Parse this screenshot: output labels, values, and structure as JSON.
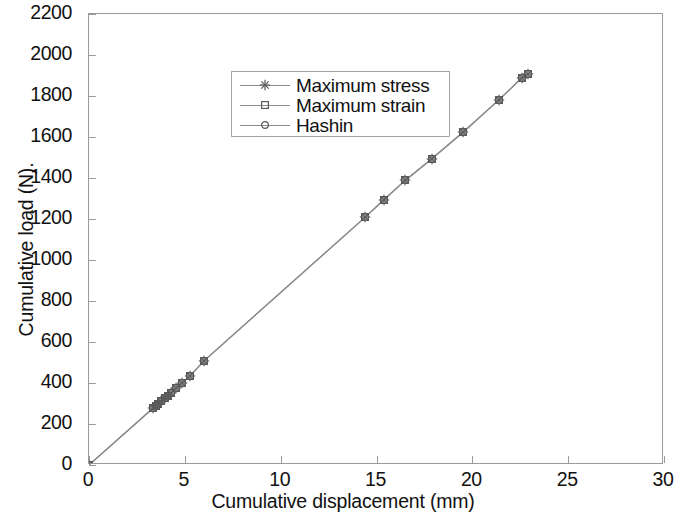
{
  "chart_data": {
    "type": "scatter",
    "title": "",
    "xlabel": "Cumulative displacement (mm)",
    "ylabel": "Cumulative load (N).",
    "xlim": [
      0,
      30
    ],
    "ylim": [
      0,
      2200
    ],
    "xticks": [
      0,
      5,
      10,
      15,
      20,
      25,
      30
    ],
    "yticks": [
      0,
      200,
      400,
      600,
      800,
      1000,
      1200,
      1400,
      1600,
      1800,
      2000,
      2200
    ],
    "grid": false,
    "legend_position": "upper-left-inside",
    "line_color": "#8d8d8d",
    "marker_color": "#5a5a5a",
    "series": [
      {
        "name": "Maximum stress",
        "marker": "asterisk",
        "x": [
          0,
          3.35,
          3.5,
          3.62,
          3.78,
          3.95,
          4.12,
          4.3,
          4.55,
          4.85,
          5.25,
          6.0,
          14.4,
          15.4,
          16.5,
          17.9,
          19.5,
          21.4,
          22.6,
          22.9
        ],
        "y": [
          0,
          278,
          290,
          300,
          312,
          325,
          338,
          352,
          375,
          400,
          432,
          508,
          1208,
          1295,
          1388,
          1495,
          1622,
          1782,
          1890,
          1908
        ]
      },
      {
        "name": "Maximum strain",
        "marker": "square",
        "x": [
          0,
          3.35,
          3.5,
          3.62,
          3.78,
          3.95,
          4.12,
          4.3,
          4.55,
          4.85,
          5.25,
          6.0,
          14.4,
          15.4,
          16.5,
          17.9,
          19.5,
          21.4,
          22.6,
          22.9
        ],
        "y": [
          0,
          278,
          290,
          300,
          312,
          325,
          338,
          352,
          375,
          400,
          432,
          508,
          1208,
          1295,
          1388,
          1495,
          1622,
          1782,
          1890,
          1908
        ]
      },
      {
        "name": "Hashin",
        "marker": "circle",
        "x": [
          0,
          3.35,
          3.5,
          3.62,
          3.78,
          3.95,
          4.12,
          4.3,
          4.55,
          4.85,
          5.25,
          6.0,
          14.4,
          15.4,
          16.5,
          17.9,
          19.5,
          21.4,
          22.6,
          22.9
        ],
        "y": [
          0,
          278,
          290,
          300,
          312,
          325,
          338,
          352,
          375,
          400,
          432,
          508,
          1208,
          1295,
          1388,
          1495,
          1622,
          1782,
          1890,
          1908
        ]
      }
    ]
  },
  "legend": {
    "items": [
      {
        "label": "Maximum stress",
        "marker": "asterisk"
      },
      {
        "label": "Maximum strain",
        "marker": "square"
      },
      {
        "label": "Hashin",
        "marker": "circle"
      }
    ]
  },
  "axes": {
    "x_title": "Cumulative displacement (mm)",
    "y_title": "Cumulative load (N).",
    "x_tick_labels": [
      "0",
      "5",
      "10",
      "15",
      "20",
      "25",
      "30"
    ],
    "y_tick_labels": [
      "0",
      "200",
      "400",
      "600",
      "800",
      "1000",
      "1200",
      "1400",
      "1600",
      "1800",
      "2000",
      "2200"
    ]
  }
}
